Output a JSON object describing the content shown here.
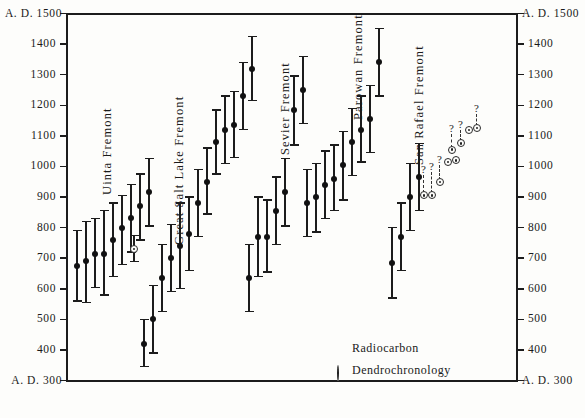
{
  "chart_data": {
    "type": "scatter",
    "title": "",
    "ylabel": "",
    "xlabel": "",
    "ylim": [
      300,
      1500
    ],
    "y_axis_prefix": "A. D. ",
    "grid": false,
    "left_axis_ticks": [
      1500,
      1400,
      1300,
      1200,
      1100,
      1000,
      900,
      800,
      700,
      600,
      500,
      400,
      300
    ],
    "right_axis_ticks": [
      1500,
      1400,
      1300,
      1200,
      1100,
      1000,
      900,
      800,
      700,
      600,
      500,
      400,
      300
    ],
    "corner_labels": {
      "top_left": "A. D. 1500",
      "top_right": "A. D. 1500",
      "bottom_left": "A. D. 300",
      "bottom_right": "A. D. 300"
    },
    "legend": {
      "position": "bottom-right-inside",
      "entries": [
        {
          "symbol": "filled-dot",
          "label": "Radiocarbon"
        },
        {
          "symbol": "circled-dot",
          "label": "Dendrochronology"
        }
      ]
    },
    "groups": [
      {
        "name": "Uinta Fremont",
        "label_x": 101,
        "label_y": 195,
        "radiocarbon": [
          {
            "x": 77,
            "value": 675,
            "low": 560,
            "high": 790
          },
          {
            "x": 86,
            "value": 690,
            "low": 555,
            "high": 820
          },
          {
            "x": 95,
            "value": 715,
            "low": 605,
            "high": 830
          },
          {
            "x": 104,
            "value": 715,
            "low": 580,
            "high": 855
          },
          {
            "x": 113,
            "value": 760,
            "low": 640,
            "high": 880
          },
          {
            "x": 122,
            "value": 800,
            "low": 680,
            "high": 905
          },
          {
            "x": 131,
            "value": 830,
            "low": 720,
            "high": 940
          },
          {
            "x": 140,
            "value": 870,
            "low": 760,
            "high": 975
          },
          {
            "x": 149,
            "value": 915,
            "low": 805,
            "high": 1025
          }
        ],
        "dendrochronology": [
          {
            "x": 134,
            "value": 730,
            "low": 690,
            "high": 775,
            "uncertain": false
          }
        ]
      },
      {
        "name": "Great Salt Lake Fremont",
        "label_x": 173,
        "label_y": 245,
        "radiocarbon": [
          {
            "x": 144,
            "value": 420,
            "low": 345,
            "high": 500
          },
          {
            "x": 153,
            "value": 500,
            "low": 390,
            "high": 610
          },
          {
            "x": 162,
            "value": 635,
            "low": 525,
            "high": 745
          },
          {
            "x": 171,
            "value": 700,
            "low": 590,
            "high": 810
          },
          {
            "x": 180,
            "value": 740,
            "low": 600,
            "high": 880
          },
          {
            "x": 189,
            "value": 780,
            "low": 660,
            "high": 900
          },
          {
            "x": 198,
            "value": 880,
            "low": 770,
            "high": 990
          },
          {
            "x": 207,
            "value": 950,
            "low": 845,
            "high": 1060
          },
          {
            "x": 216,
            "value": 1080,
            "low": 975,
            "high": 1185
          },
          {
            "x": 225,
            "value": 1120,
            "low": 1010,
            "high": 1230
          },
          {
            "x": 234,
            "value": 1135,
            "low": 1030,
            "high": 1245
          },
          {
            "x": 243,
            "value": 1230,
            "low": 1120,
            "high": 1340
          },
          {
            "x": 252,
            "value": 1320,
            "low": 1215,
            "high": 1425
          }
        ],
        "dendrochronology": []
      },
      {
        "name": "Sevier Fremont",
        "label_x": 279,
        "label_y": 155,
        "radiocarbon": [
          {
            "x": 249,
            "value": 635,
            "low": 525,
            "high": 745
          },
          {
            "x": 258,
            "value": 770,
            "low": 640,
            "high": 900
          },
          {
            "x": 267,
            "value": 770,
            "low": 655,
            "high": 890
          },
          {
            "x": 276,
            "value": 855,
            "low": 745,
            "high": 965
          },
          {
            "x": 285,
            "value": 915,
            "low": 805,
            "high": 1025
          },
          {
            "x": 294,
            "value": 1185,
            "low": 1070,
            "high": 1295
          },
          {
            "x": 303,
            "value": 1250,
            "low": 1140,
            "high": 1360
          }
        ],
        "dendrochronology": []
      },
      {
        "name": "Parowan Fremont",
        "label_x": 352,
        "label_y": 120,
        "radiocarbon": [
          {
            "x": 307,
            "value": 880,
            "low": 770,
            "high": 990
          },
          {
            "x": 316,
            "value": 900,
            "low": 785,
            "high": 1010
          },
          {
            "x": 325,
            "value": 940,
            "low": 830,
            "high": 1050
          },
          {
            "x": 334,
            "value": 960,
            "low": 855,
            "high": 1070
          },
          {
            "x": 343,
            "value": 1005,
            "low": 890,
            "high": 1115
          },
          {
            "x": 352,
            "value": 1080,
            "low": 970,
            "high": 1190
          },
          {
            "x": 361,
            "value": 1120,
            "low": 1015,
            "high": 1230
          },
          {
            "x": 370,
            "value": 1155,
            "low": 1045,
            "high": 1265
          },
          {
            "x": 379,
            "value": 1340,
            "low": 1230,
            "high": 1450
          }
        ],
        "dendrochronology": []
      },
      {
        "name": "San Rafael Fremont",
        "label_x": 413,
        "label_y": 165,
        "radiocarbon": [
          {
            "x": 392,
            "value": 685,
            "low": 570,
            "high": 800
          },
          {
            "x": 401,
            "value": 770,
            "low": 660,
            "high": 880
          },
          {
            "x": 410,
            "value": 900,
            "low": 790,
            "high": 1010
          },
          {
            "x": 419,
            "value": 965,
            "low": 855,
            "high": 1075
          }
        ],
        "dendrochronology": [
          {
            "x": 424,
            "value": 905,
            "uncertain": true,
            "q_value": 1000
          },
          {
            "x": 432,
            "value": 905,
            "uncertain": true,
            "q_value": 1010
          },
          {
            "x": 440,
            "value": 950,
            "uncertain": true,
            "q_value": 1035
          },
          {
            "x": 448,
            "value": 1015,
            "uncertain": false
          },
          {
            "x": 456,
            "value": 1020,
            "uncertain": false
          },
          {
            "x": 452,
            "value": 1055,
            "uncertain": true,
            "q_value": 1135
          },
          {
            "x": 461,
            "value": 1075,
            "uncertain": true,
            "q_value": 1150
          },
          {
            "x": 469,
            "value": 1120,
            "uncertain": false
          },
          {
            "x": 477,
            "value": 1125,
            "uncertain": true,
            "q_value": 1200
          }
        ]
      }
    ]
  }
}
